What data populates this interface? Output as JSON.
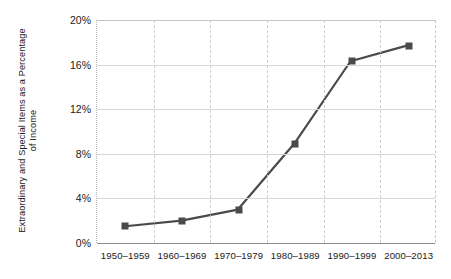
{
  "chart_data": {
    "type": "line",
    "title": "",
    "xlabel": "",
    "ylabel": "Extraordinary and Special Items as a Percentage\nof Income",
    "categories": [
      "1950–1959",
      "1960–1969",
      "1970–1979",
      "1980–1989",
      "1990–1999",
      "2000–2013"
    ],
    "values": [
      1.5,
      2.0,
      3.0,
      8.9,
      16.3,
      17.7
    ],
    "ylim": [
      0,
      20
    ],
    "ytick_values": [
      0,
      4,
      8,
      12,
      16,
      20
    ],
    "ytick_labels": [
      "0%",
      "4%",
      "8%",
      "12%",
      "16%",
      "20%"
    ],
    "grid": {
      "horizontal": true,
      "vertical": true,
      "vertical_style": "dashed"
    },
    "legend": null,
    "series_color": "#4a4a4a",
    "marker": "square",
    "annotations": []
  }
}
